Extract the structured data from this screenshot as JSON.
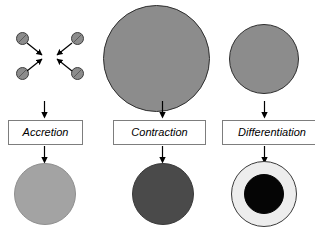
{
  "diagram": {
    "columns": [
      {
        "id": "accretion",
        "stage_label": "Accretion",
        "top_art": "four-particles-converging",
        "particles": [
          {
            "name": "particle-top-left",
            "x": 16,
            "y": 32
          },
          {
            "name": "particle-top-right",
            "x": 71,
            "y": 32
          },
          {
            "name": "particle-bottom-left",
            "x": 16,
            "y": 67
          },
          {
            "name": "particle-bottom-right",
            "x": 71,
            "y": 67
          }
        ],
        "result_shape": "light-gray-sphere",
        "result_color": "#a3a3a3"
      },
      {
        "id": "contraction",
        "stage_label": "Contraction",
        "top_art": "large-gray-sphere",
        "top_color": "#8c8c8c",
        "result_shape": "smaller-dark-gray-sphere",
        "result_color": "#4a4a4a"
      },
      {
        "id": "differentiation",
        "stage_label": "Differentiation",
        "top_art": "medium-gray-sphere",
        "top_color": "#8c8c8c",
        "result_shape": "pale-sphere-with-black-core",
        "result_color": "#ededed",
        "result_core_color": "#050505"
      }
    ],
    "colors": {
      "particle_fill": "#8c8c8c",
      "particle_outline": "#3d3d3d",
      "sphere_gray": "#8c8c8c",
      "sphere_outline": "#2e2e2e",
      "arrow": "#000000",
      "box_border": "#7d7d7d",
      "background": "#ffffff"
    },
    "icons": {
      "flow_arrow": "arrow-down-icon",
      "converge_arrow": "arrow-diagonal-icon"
    }
  }
}
